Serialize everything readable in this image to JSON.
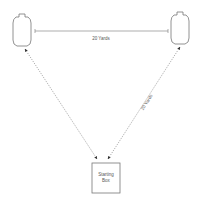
{
  "diagram": {
    "colors": {
      "stroke": "#777777",
      "text": "#555555",
      "background": "#ffffff"
    },
    "targets": [
      {
        "name": "left-target"
      },
      {
        "name": "right-target"
      }
    ],
    "top_distance_label": "20 Yards",
    "right_distance_label": "20 Yards",
    "starting_box": {
      "line1": "Starting",
      "line2": "Box"
    }
  }
}
